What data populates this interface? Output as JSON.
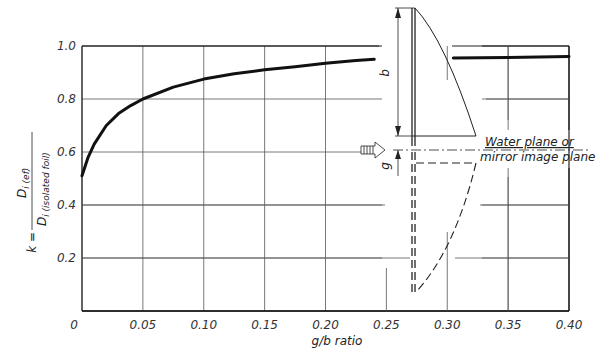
{
  "chart_data": {
    "type": "line",
    "title": "",
    "xlabel": "g/b ratio",
    "ylabel": "k = D_i(ef) / D_i(isolated foil)",
    "ylabel_parts": {
      "prefix": "k =",
      "numerator": "D",
      "numerator_sub": "i (ef)",
      "denominator": "D",
      "denominator_sub": "i (isolated foil)"
    },
    "xlim": [
      0,
      0.4
    ],
    "ylim": [
      0,
      1.0
    ],
    "grid": true,
    "x_ticks": [
      "0",
      "0.05",
      "0.10",
      "0.15",
      "0.20",
      "0.25",
      "0.30",
      "0.35",
      "0.40"
    ],
    "y_ticks": [
      "0.2",
      "0.4",
      "0.6",
      "0.8",
      "1.0"
    ],
    "series": [
      {
        "name": "k vs g/b",
        "x": [
          0.0,
          0.005,
          0.01,
          0.02,
          0.03,
          0.04,
          0.05,
          0.075,
          0.1,
          0.125,
          0.15,
          0.175,
          0.2,
          0.225,
          0.24
        ],
        "y": [
          0.51,
          0.58,
          0.63,
          0.7,
          0.745,
          0.775,
          0.8,
          0.845,
          0.875,
          0.895,
          0.91,
          0.922,
          0.935,
          0.945,
          0.95
        ]
      },
      {
        "name": "k vs g/b (continued)",
        "x": [
          0.305,
          0.35,
          0.4
        ],
        "y": [
          0.955,
          0.957,
          0.96
        ]
      }
    ],
    "annotations": [
      {
        "text": "Water plane or",
        "type": "label"
      },
      {
        "text": "mirror image plane",
        "type": "label"
      },
      {
        "text": "b",
        "type": "dimension"
      },
      {
        "text": "g",
        "type": "dimension"
      }
    ]
  },
  "labels": {
    "water_plane_line1": "Water plane or",
    "water_plane_line2": "mirror image plane",
    "dim_b": "b",
    "dim_g": "g",
    "xlabel": "g/b ratio",
    "k_eq": "k =",
    "num_D": "D",
    "num_sub": "i (ef)",
    "den_D": "D",
    "den_sub": "i (isolated foil)"
  }
}
